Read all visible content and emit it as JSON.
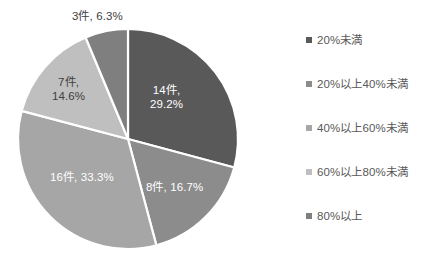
{
  "chart_data": {
    "type": "pie",
    "title": "",
    "subtitle": "",
    "xlabel": "",
    "ylabel": "",
    "grid": false,
    "legend_position": "right",
    "total_count": 48,
    "unit_suffix": "件",
    "categories": [
      "20%未満",
      "20%以上40%未満",
      "40%以上60%未満",
      "60%以上80%未満",
      "80%以上"
    ],
    "values": [
      14,
      8,
      16,
      7,
      3
    ],
    "percents": [
      29.2,
      16.7,
      33.3,
      14.6,
      6.3
    ],
    "colors": [
      "#595959",
      "#8C8C8C",
      "#A6A6A6",
      "#BFBFBF",
      "#7F7F7F"
    ],
    "slices": [
      {
        "category": "20%未満",
        "count": 14,
        "percent": 29.2,
        "color": "#595959",
        "label_line1": "14件,",
        "label_line2": "29.2%",
        "label_full": "14件, 29.2%",
        "label_placement": "inside",
        "label_color": "#FFFFFF"
      },
      {
        "category": "20%以上40%未満",
        "count": 8,
        "percent": 16.7,
        "color": "#8C8C8C",
        "label_line1": "8件, 16.7%",
        "label_line2": "",
        "label_full": "8件, 16.7%",
        "label_placement": "inside",
        "label_color": "#FFFFFF"
      },
      {
        "category": "40%以上60%未満",
        "count": 16,
        "percent": 33.3,
        "color": "#A6A6A6",
        "label_line1": "16件, 33.3%",
        "label_line2": "",
        "label_full": "16件, 33.3%",
        "label_placement": "inside",
        "label_color": "#FFFFFF"
      },
      {
        "category": "60%以上80%未満",
        "count": 7,
        "percent": 14.6,
        "color": "#BFBFBF",
        "label_line1": "7件,",
        "label_line2": "14.6%",
        "label_full": "7件, 14.6%",
        "label_placement": "inside",
        "label_color": "#404040"
      },
      {
        "category": "80%以上",
        "count": 3,
        "percent": 6.3,
        "color": "#7F7F7F",
        "label_line1": "3件, 6.3%",
        "label_line2": "",
        "label_full": "3件, 6.3%",
        "label_placement": "outside",
        "label_color": "#404040"
      }
    ]
  },
  "legend": {
    "items": [
      {
        "label": "20%未満",
        "color": "#595959"
      },
      {
        "label": "20%以上40%未満",
        "color": "#8C8C8C"
      },
      {
        "label": "40%以上60%未満",
        "color": "#A6A6A6"
      },
      {
        "label": "60%以上80%未満",
        "color": "#BFBFBF"
      },
      {
        "label": "80%以上",
        "color": "#7F7F7F"
      }
    ]
  },
  "labels": {
    "slice1_line1": "14件,",
    "slice1_line2": "29.2%",
    "slice2": "8件, 16.7%",
    "slice3": "16件, 33.3%",
    "slice4_line1": "7件,",
    "slice4_line2": "14.6%",
    "slice5": "3件, 6.3%"
  }
}
